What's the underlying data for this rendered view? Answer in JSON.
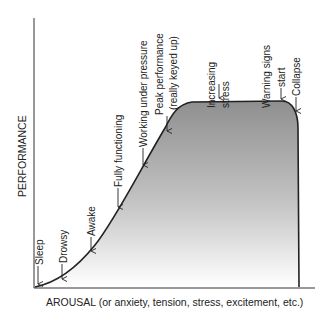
{
  "diagram": {
    "type": "performance-arousal-curve",
    "y_axis_label": "PERFORMANCE",
    "x_axis_label": "AROUSAL (or anxiety, tension, stress, excitement, etc.)",
    "curve_color": "#222222",
    "fill_gradient": {
      "top": "#8f8f8f",
      "bottom": "#ffffff"
    },
    "annotations": [
      {
        "id": "sleep",
        "lines": [
          "Sleep"
        ]
      },
      {
        "id": "drowsy",
        "lines": [
          "Drowsy"
        ]
      },
      {
        "id": "awake",
        "lines": [
          "Awake"
        ]
      },
      {
        "id": "fully-functioning",
        "lines": [
          "Fully functioning"
        ]
      },
      {
        "id": "working-under-pressure",
        "lines": [
          "Working under pressure"
        ]
      },
      {
        "id": "peak-performance",
        "lines": [
          "Peak performance",
          "(really keyed up)"
        ]
      },
      {
        "id": "increasing-stress",
        "lines": [
          "Increasing",
          "stress"
        ]
      },
      {
        "id": "warning-signs",
        "lines": [
          "Warning signs",
          "start"
        ]
      },
      {
        "id": "collapse",
        "lines": [
          "Collapse"
        ]
      }
    ]
  }
}
